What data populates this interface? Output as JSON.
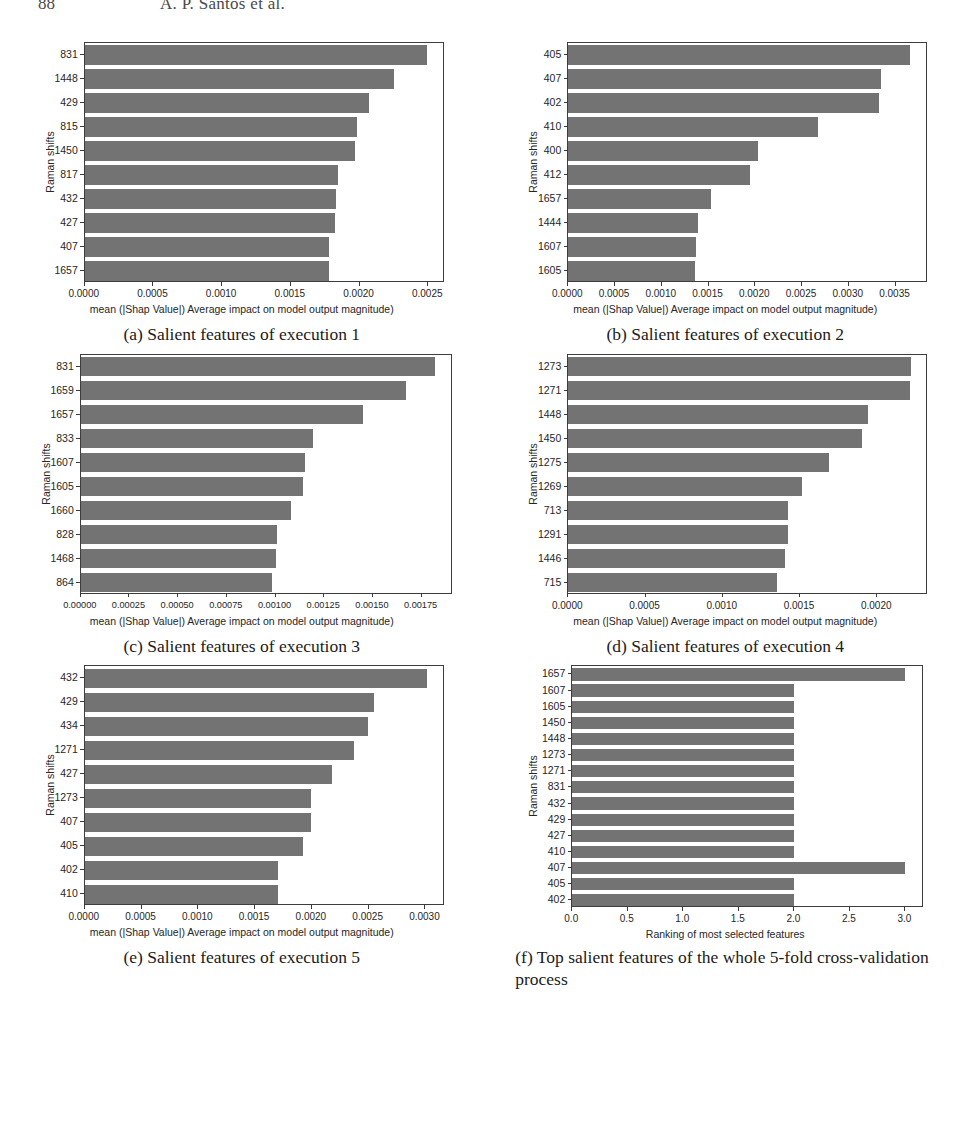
{
  "page": {
    "folio": "88",
    "running_head": "A. P. Santos et al."
  },
  "common": {
    "ylabel": "Raman shifts",
    "shap_xlabel": "mean (|Shap Value|) Average impact on model output magnitude)",
    "bar_color": "#737373",
    "axis_color": "#3d3d3d"
  },
  "chart_data": [
    {
      "id": "a",
      "type": "bar",
      "orientation": "horizontal",
      "title": "",
      "caption": "(a) Salient features of execution 1",
      "xlabel": "mean (|Shap Value|) Average impact on model output magnitude)",
      "ylabel": "Raman shifts",
      "categories": [
        "831",
        "1448",
        "429",
        "815",
        "1450",
        "817",
        "432",
        "427",
        "407",
        "1657"
      ],
      "values": [
        0.00249,
        0.00225,
        0.00207,
        0.00198,
        0.00197,
        0.00184,
        0.00183,
        0.00182,
        0.00178,
        0.00178
      ],
      "xlim": [
        0,
        0.00262
      ],
      "xticks": [
        0,
        0.0005,
        0.001,
        0.0015,
        0.002,
        0.0025
      ],
      "xticklabels": [
        "0.0000",
        "0.0005",
        "0.0010",
        "0.0015",
        "0.0020",
        "0.0025"
      ],
      "grid": false,
      "legend": null
    },
    {
      "id": "b",
      "type": "bar",
      "orientation": "horizontal",
      "title": "",
      "caption": "(b) Salient features of execution 2",
      "xlabel": "mean (|Shap Value|) Average impact on model output magnitude)",
      "ylabel": "Raman shifts",
      "categories": [
        "405",
        "407",
        "402",
        "410",
        "400",
        "412",
        "1657",
        "1444",
        "1607",
        "1605"
      ],
      "values": [
        0.00366,
        0.00334,
        0.00332,
        0.00267,
        0.00203,
        0.00194,
        0.00153,
        0.00139,
        0.00137,
        0.00136
      ],
      "xlim": [
        0,
        0.00385
      ],
      "xticks": [
        0,
        0.0005,
        0.001,
        0.0015,
        0.002,
        0.0025,
        0.003,
        0.0035
      ],
      "xticklabels": [
        "0.0000",
        "0.0005",
        "0.0010",
        "0.0015",
        "0.0020",
        "0.0025",
        "0.0030",
        "0.0035"
      ],
      "grid": false,
      "legend": null
    },
    {
      "id": "c",
      "type": "bar",
      "orientation": "horizontal",
      "title": "",
      "caption": "(c) Salient features of execution 3",
      "xlabel": "mean (|Shap Value|) Average impact on model output magnitude)",
      "ylabel": "Raman shifts",
      "categories": [
        "831",
        "1659",
        "1657",
        "833",
        "1607",
        "1605",
        "1660",
        "828",
        "1468",
        "864"
      ],
      "values": [
        0.00182,
        0.00167,
        0.00145,
        0.00119,
        0.00115,
        0.00114,
        0.00108,
        0.00101,
        0.001,
        0.00098
      ],
      "xlim": [
        0,
        0.00191
      ],
      "xticks": [
        0,
        0.00025,
        0.0005,
        0.00075,
        0.001,
        0.00125,
        0.0015,
        0.00175
      ],
      "xticklabels": [
        "0.00000",
        "0.00025",
        "0.00050",
        "0.00075",
        "0.00100",
        "0.00125",
        "0.00150",
        "0.00175"
      ],
      "grid": false,
      "legend": null
    },
    {
      "id": "d",
      "type": "bar",
      "orientation": "horizontal",
      "title": "",
      "caption": "(d) Salient features of execution 4",
      "xlabel": "mean (|Shap Value|) Average impact on model output magnitude)",
      "ylabel": "Raman shifts",
      "categories": [
        "1273",
        "1271",
        "1448",
        "1450",
        "1275",
        "1269",
        "713",
        "1291",
        "1446",
        "715"
      ],
      "values": [
        0.00222,
        0.00221,
        0.00194,
        0.0019,
        0.00169,
        0.00151,
        0.00142,
        0.00142,
        0.0014,
        0.00135
      ],
      "xlim": [
        0,
        0.00233
      ],
      "xticks": [
        0,
        0.0005,
        0.001,
        0.0015,
        0.002
      ],
      "xticklabels": [
        "0.0000",
        "0.0005",
        "0.0010",
        "0.0015",
        "0.0020"
      ],
      "grid": false,
      "legend": null
    },
    {
      "id": "e",
      "type": "bar",
      "orientation": "horizontal",
      "title": "",
      "caption": "(e) Salient features of execution 5",
      "xlabel": "mean (|Shap Value|) Average impact on model output magnitude)",
      "ylabel": "Raman shifts",
      "categories": [
        "432",
        "429",
        "434",
        "1271",
        "427",
        "1273",
        "407",
        "405",
        "402",
        "410"
      ],
      "values": [
        0.00301,
        0.00255,
        0.00249,
        0.00237,
        0.00218,
        0.00199,
        0.00199,
        0.00192,
        0.0017,
        0.0017
      ],
      "xlim": [
        0,
        0.00317
      ],
      "xticks": [
        0,
        0.0005,
        0.001,
        0.0015,
        0.002,
        0.0025,
        0.003
      ],
      "xticklabels": [
        "0.0000",
        "0.0005",
        "0.0010",
        "0.0015",
        "0.0020",
        "0.0025",
        "0.0030"
      ],
      "grid": false,
      "legend": null
    },
    {
      "id": "f",
      "type": "bar",
      "orientation": "horizontal",
      "title": "",
      "caption": "(f) Top salient features of the whole 5-fold cross-validation process",
      "xlabel": "Ranking of most selected features",
      "ylabel": "Raman shifts",
      "categories": [
        "1657",
        "1607",
        "1605",
        "1450",
        "1448",
        "1273",
        "1271",
        "831",
        "432",
        "429",
        "427",
        "410",
        "407",
        "405",
        "402"
      ],
      "values": [
        3,
        2,
        2,
        2,
        2,
        2,
        2,
        2,
        2,
        2,
        2,
        2,
        3,
        2,
        2
      ],
      "xlim": [
        0,
        3.17
      ],
      "xticks": [
        0,
        0.5,
        1.0,
        1.5,
        2.0,
        2.5,
        3.0
      ],
      "xticklabels": [
        "0.0",
        "0.5",
        "1.0",
        "1.5",
        "2.0",
        "2.5",
        "3.0"
      ],
      "grid": false,
      "legend": null
    }
  ]
}
